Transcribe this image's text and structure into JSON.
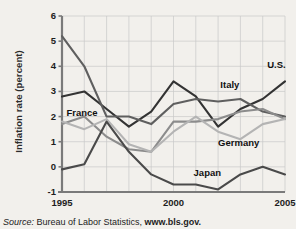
{
  "chart_data": {
    "type": "line",
    "title": "",
    "subtitle": "",
    "xlabel": "",
    "ylabel": "Inflation rate (percent)",
    "x": [
      1995,
      1996,
      1997,
      1998,
      1999,
      2000,
      2001,
      2002,
      2003,
      2004,
      2005
    ],
    "xlim": [
      1995,
      2005
    ],
    "ylim": [
      -1,
      6
    ],
    "yticks": [
      6,
      5,
      4,
      3,
      2,
      1,
      0,
      -1
    ],
    "ytick_labels": [
      "6",
      "5",
      "4",
      "3",
      "2",
      "1",
      "0",
      "-1"
    ],
    "xticks": [
      1995,
      2000,
      2005
    ],
    "xtick_labels": [
      "1995",
      "2000",
      "2005"
    ],
    "grid": true,
    "legend": "inline-annotations",
    "series": [
      {
        "name": "U.S.",
        "color": "#333333",
        "values": [
          2.8,
          3.0,
          2.3,
          1.6,
          2.2,
          3.4,
          2.8,
          1.6,
          2.3,
          2.7,
          3.4
        ]
      },
      {
        "name": "Italy",
        "color": "#5f5f5f",
        "values": [
          5.2,
          4.0,
          2.0,
          2.0,
          1.7,
          2.5,
          2.7,
          2.6,
          2.7,
          2.2,
          2.0
        ]
      },
      {
        "name": "France",
        "color": "#8c8c8c",
        "values": [
          1.7,
          2.0,
          1.2,
          0.7,
          0.6,
          1.8,
          1.8,
          1.9,
          2.2,
          2.3,
          1.9
        ]
      },
      {
        "name": "Germany",
        "color": "#b4b4b4",
        "values": [
          1.8,
          1.5,
          1.9,
          0.9,
          0.6,
          1.4,
          2.0,
          1.4,
          1.1,
          1.7,
          1.9
        ]
      },
      {
        "name": "Japan",
        "color": "#4a4a4a",
        "values": [
          -0.1,
          0.1,
          1.8,
          0.6,
          -0.3,
          -0.7,
          -0.7,
          -0.9,
          -0.3,
          0.0,
          -0.3
        ]
      }
    ],
    "annotations": [
      {
        "text": "U.S.",
        "x": 2004.2,
        "y": 4.05
      },
      {
        "text": "Italy",
        "x": 2002.1,
        "y": 3.25
      },
      {
        "text": "Germany",
        "x": 2002.0,
        "y": 0.95
      },
      {
        "text": "Japan",
        "x": 2000.9,
        "y": -0.25
      },
      {
        "text": "France",
        "x": 1995.2,
        "y": 2.15
      }
    ]
  },
  "source": {
    "prefix": "Source:",
    "body": " Bureau of Labor Statistics, ",
    "link": "www.bls.gov."
  }
}
